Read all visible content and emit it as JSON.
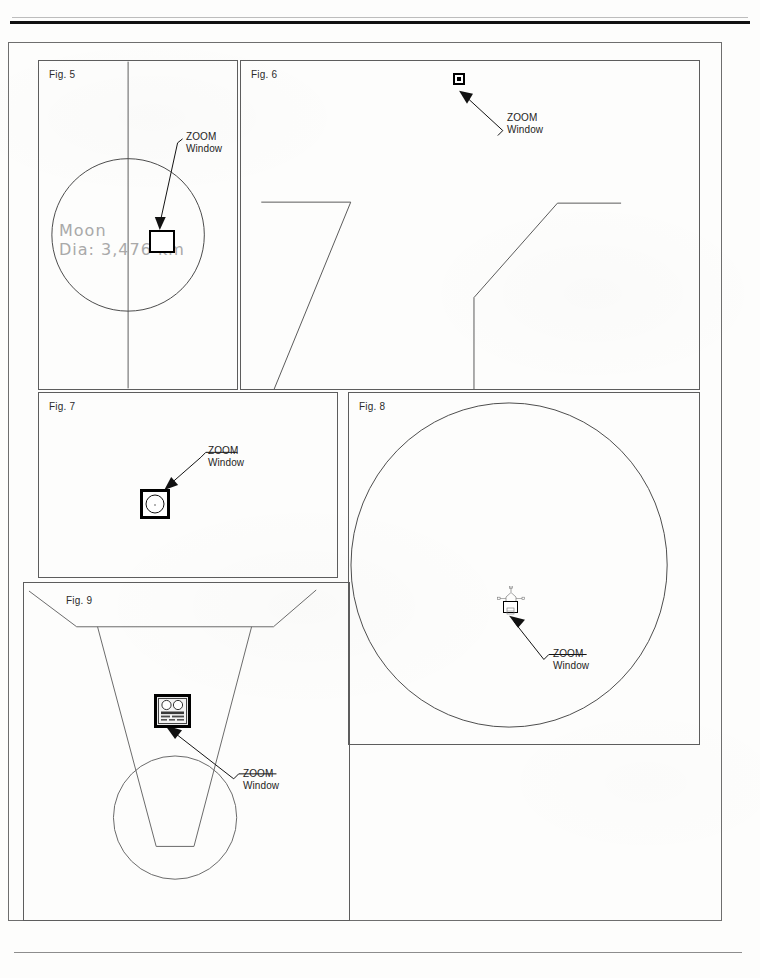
{
  "sheet": {
    "type": "technical-drawing-sheet",
    "background_color": "#fdfdfc",
    "line_color": "#5d5d5d",
    "rule_color": "#111111"
  },
  "callout_label": {
    "line1": "ZOOM",
    "line2": "Window"
  },
  "figures": [
    {
      "id": "fig5",
      "label": "Fig. 5",
      "annotation_line1": "Moon",
      "annotation_line2": "Dia: 3,476 km",
      "callout": {
        "line1": "ZOOM",
        "line2": "Window"
      },
      "zoom_window": "plain-square"
    },
    {
      "id": "fig6",
      "label": "Fig. 6",
      "callout": {
        "line1": "ZOOM",
        "line2": "Window"
      },
      "zoom_window": "tiny-filled-square"
    },
    {
      "id": "fig7",
      "label": "Fig. 7",
      "callout": {
        "line1": "ZOOM",
        "line2": "Window"
      },
      "zoom_window": "square-with-circle"
    },
    {
      "id": "fig8",
      "label": "Fig. 8",
      "callout": {
        "line1": "ZOOM",
        "line2": "Window"
      },
      "zoom_window": "micro-spacecraft-glyph"
    },
    {
      "id": "fig9",
      "label": "Fig. 9",
      "callout": {
        "line1": "ZOOM",
        "line2": "Window"
      },
      "zoom_window": "control-panel-glyph"
    }
  ]
}
